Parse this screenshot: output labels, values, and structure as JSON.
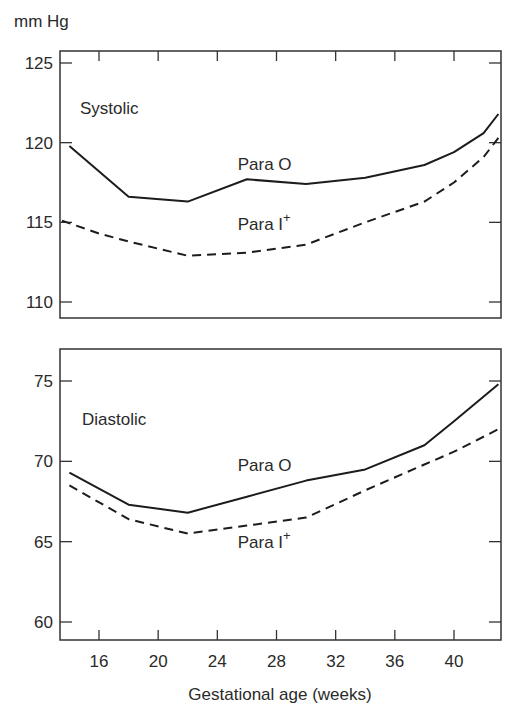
{
  "chart_data": {
    "type": "line",
    "ylabel": "mm Hg",
    "xlabel": "Gestational age (weeks)",
    "x_ticks": [
      16,
      20,
      24,
      28,
      32,
      36,
      40
    ],
    "xlim": [
      13.5,
      43
    ],
    "grid": false,
    "panels": [
      {
        "title": "Systolic",
        "ylim": [
          109,
          126
        ],
        "y_ticks": [
          110,
          115,
          120,
          125
        ],
        "series": [
          {
            "name": "Para O",
            "style": "solid",
            "x": [
              14,
              18,
              22,
              26,
              30,
              34,
              38,
              40,
              42,
              43
            ],
            "values": [
              119.8,
              116.6,
              116.3,
              117.7,
              117.4,
              117.8,
              118.6,
              119.4,
              120.6,
              121.8
            ]
          },
          {
            "name": "Para I+",
            "style": "dashed",
            "x": [
              13.5,
              16,
              18,
              22,
              26,
              30,
              34,
              38,
              40,
              42,
              43
            ],
            "values": [
              115.1,
              114.3,
              113.8,
              112.9,
              113.1,
              113.6,
              115.0,
              116.3,
              117.5,
              119.1,
              120.3
            ]
          }
        ],
        "labels": [
          {
            "text": "Para O",
            "x": 27,
            "y": 118.3
          },
          {
            "text": "Para I",
            "sup": "+",
            "x": 27,
            "y": 114.5
          }
        ]
      },
      {
        "title": "Diastolic",
        "ylim": [
          59,
          77
        ],
        "y_ticks": [
          60,
          65,
          70,
          75
        ],
        "series": [
          {
            "name": "Para O",
            "style": "solid",
            "x": [
              14,
              18,
              22,
              26,
              30,
              34,
              38,
              40,
              43
            ],
            "values": [
              69.3,
              67.3,
              66.8,
              67.8,
              68.8,
              69.5,
              71.0,
              72.5,
              74.8
            ]
          },
          {
            "name": "Para I+",
            "style": "dashed",
            "x": [
              14,
              18,
              22,
              26,
              30,
              34,
              38,
              40,
              43
            ],
            "values": [
              68.5,
              66.4,
              65.5,
              66.0,
              66.5,
              68.2,
              69.8,
              70.6,
              72.0
            ]
          }
        ],
        "labels": [
          {
            "text": "Para O",
            "x": 27,
            "y": 69.4
          },
          {
            "text": "Para I",
            "sup": "+",
            "x": 27,
            "y": 64.6
          }
        ]
      }
    ]
  }
}
